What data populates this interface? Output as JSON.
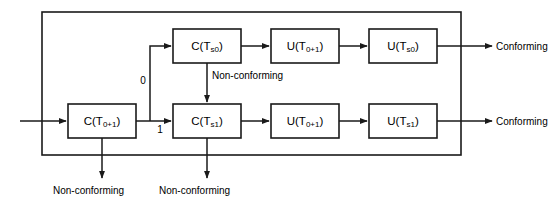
{
  "diagram": {
    "colors": {
      "line": "#1a1a1a",
      "box_fill": "#ffffff",
      "background": "#ffffff",
      "text": "#000000"
    },
    "boxes": [
      {
        "id": "c_t01",
        "base": "C(T",
        "sub": "0+1",
        "tail": ")",
        "x": 68,
        "y": 104,
        "w": 68,
        "h": 34
      },
      {
        "id": "c_ts0",
        "base": "C(T",
        "sub": "s0",
        "tail": ")",
        "x": 173,
        "y": 29,
        "w": 68,
        "h": 34
      },
      {
        "id": "c_ts1",
        "base": "C(T",
        "sub": "s1",
        "tail": ")",
        "x": 173,
        "y": 104,
        "w": 68,
        "h": 34
      },
      {
        "id": "u_t01_top",
        "base": "U(T",
        "sub": "0+1",
        "tail": ")",
        "x": 271,
        "y": 29,
        "w": 68,
        "h": 34
      },
      {
        "id": "u_ts0",
        "base": "U(T",
        "sub": "s0",
        "tail": ")",
        "x": 369,
        "y": 29,
        "w": 68,
        "h": 34
      },
      {
        "id": "u_t01_bot",
        "base": "U(T",
        "sub": "0+1",
        "tail": ")",
        "x": 271,
        "y": 104,
        "w": 68,
        "h": 34
      },
      {
        "id": "u_ts1",
        "base": "U(T",
        "sub": "s1",
        "tail": ")",
        "x": 369,
        "y": 104,
        "w": 68,
        "h": 34
      }
    ],
    "box_text": {
      "c_t01": "C(T0+1)",
      "c_ts0": "C(Ts0)",
      "c_ts1": "C(Ts1)",
      "u_t01_top": "U(T0+1)",
      "u_ts0": "U(Ts0)",
      "u_t01_bot": "U(T0+1)",
      "u_ts1": "U(Ts1)"
    },
    "branch_labels": {
      "zero": "0",
      "one": "1"
    },
    "edge_labels": {
      "nonconforming_mid": "Non-conforming",
      "nonconforming_left": "Non-conforming",
      "nonconforming_center": "Non-conforming",
      "conforming_top": "Conforming",
      "conforming_bottom": "Conforming"
    },
    "outer_frame": {
      "x": 42,
      "y": 12,
      "w": 419,
      "h": 143
    }
  }
}
